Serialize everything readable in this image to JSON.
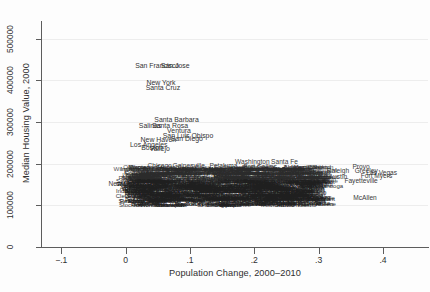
{
  "chart_data": {
    "type": "scatter",
    "title": "",
    "xlabel": "Population Change, 2000–2010",
    "ylabel": "Median Housing Value, 2000",
    "xlim": [
      -0.13,
      0.47
    ],
    "ylim": [
      0,
      540000
    ],
    "xticks": [
      -0.1,
      0,
      0.1,
      0.2,
      0.3,
      0.4
    ],
    "xticklabels": [
      "−.1",
      "0",
      ".1",
      ".2",
      ".3",
      ".4"
    ],
    "yticks": [
      0,
      100000,
      200000,
      300000,
      400000,
      500000
    ],
    "yticklabels": [
      "0",
      "100000",
      "200000",
      "300000",
      "400000",
      "500000"
    ],
    "grid": "horizontal",
    "legend": "none",
    "marker_style": "text-labels",
    "note": "Each observation is rendered as the metro-area name rather than a point marker; the central mass of labels overplots into a solid band.",
    "points": [
      {
        "label": "San Francisco",
        "x": 0.049,
        "y": 437000
      },
      {
        "label": "San Jose",
        "x": 0.077,
        "y": 437000
      },
      {
        "label": "New York",
        "x": 0.055,
        "y": 396000
      },
      {
        "label": "Santa Cruz",
        "x": 0.058,
        "y": 383000
      },
      {
        "label": "Santa Barbara",
        "x": 0.079,
        "y": 307000
      },
      {
        "label": "Santa Rosa",
        "x": 0.069,
        "y": 294000
      },
      {
        "label": "Salinas",
        "x": 0.038,
        "y": 292000
      },
      {
        "label": "Ventura",
        "x": 0.083,
        "y": 281000
      },
      {
        "label": "San Luis Obispo",
        "x": 0.097,
        "y": 268000
      },
      {
        "label": "San Diego",
        "x": 0.095,
        "y": 262000
      },
      {
        "label": "New Haven",
        "x": 0.051,
        "y": 259000
      },
      {
        "label": "Los Angeles",
        "x": 0.036,
        "y": 247000
      },
      {
        "label": "Boston",
        "x": 0.041,
        "y": 239000
      },
      {
        "label": "Vallejo",
        "x": 0.053,
        "y": 238000
      },
      {
        "label": "Washington",
        "x": 0.197,
        "y": 206000
      },
      {
        "label": "Santa Fe",
        "x": 0.247,
        "y": 206000
      },
      {
        "label": "Chicago",
        "x": 0.053,
        "y": 196000
      },
      {
        "label": "Gainesville",
        "x": 0.098,
        "y": 196000
      },
      {
        "label": "Petaluma",
        "x": 0.152,
        "y": 196000
      },
      {
        "label": "Fort Collins",
        "x": 0.209,
        "y": 194000
      },
      {
        "label": "Naples",
        "x": 0.263,
        "y": 192000
      },
      {
        "label": "Raleigh",
        "x": 0.33,
        "y": 186000
      },
      {
        "label": "Provo",
        "x": 0.366,
        "y": 195000
      },
      {
        "label": "Greeley",
        "x": 0.374,
        "y": 186000
      },
      {
        "label": "Las Vegas",
        "x": 0.398,
        "y": 181000
      },
      {
        "label": "Fort Myers",
        "x": 0.39,
        "y": 172000
      },
      {
        "label": "Fayetteville",
        "x": 0.366,
        "y": 160000
      },
      {
        "label": "Detroit",
        "x": 0.024,
        "y": 173000
      },
      {
        "label": "Providence",
        "x": 0.048,
        "y": 173000
      },
      {
        "label": "Pittsburgh",
        "x": 0.036,
        "y": 164000
      },
      {
        "label": "New Orleans",
        "x": 0.003,
        "y": 153000
      },
      {
        "label": "Youngstown",
        "x": 0.021,
        "y": 142000
      },
      {
        "label": "Pine Bluff",
        "x": 0.02,
        "y": 131000
      },
      {
        "label": "Salt Lake City",
        "x": 0.163,
        "y": 183000
      },
      {
        "label": "Nashville",
        "x": 0.14,
        "y": 166000
      },
      {
        "label": "Phoenix",
        "x": 0.2,
        "y": 166000
      },
      {
        "label": "Austin",
        "x": 0.33,
        "y": 170000
      },
      {
        "label": "Bakersfield",
        "x": 0.253,
        "y": 155000
      },
      {
        "label": "Odessa",
        "x": 0.205,
        "y": 122000
      },
      {
        "label": "Brownsville",
        "x": 0.262,
        "y": 120000
      },
      {
        "label": "McAllen",
        "x": 0.372,
        "y": 120000
      },
      {
        "label": "Laredo",
        "x": 0.296,
        "y": 131000
      },
      {
        "label": "Colorado Springs",
        "x": 0.247,
        "y": 176000
      }
    ]
  },
  "axes": {
    "y_title": "Median Housing Value, 2000",
    "x_title": "Population Change, 2000–2010",
    "y_tick_labels": [
      "0",
      "100000",
      "200000",
      "300000",
      "400000",
      "500000"
    ],
    "x_tick_labels": [
      "−.1",
      "0",
      ".1",
      ".2",
      ".3",
      ".4"
    ]
  },
  "dense_band": {
    "rows": [
      "Seattle Denver Portland Minneapolis Sacramento Baltimore Hartford Worcester Stockton Modesto Fresno Reno Tucson Boise Olympia Bremerton Bellingham Wenatchee",
      "Philadelphia Milwaukee Cleveland Columbus Cincinnati Kansas City St. Louis Indianapolis Louisville Memphis Birmingham Richmond Norfolk Charlotte Atlanta Orlando Tampa Jacksonville",
      "Buffalo Rochester Syracuse Albany Scranton Allentown Harrisburg Lancaster Reading Erie Toledo Dayton Akron Canton Flint Lansing Grand Rapids South Bend Fort Wayne Peoria Rockford",
      "Shreveport Baton Rouge Jackson Mobile Montgomery Huntsville Chattanooga Knoxville Greensboro Columbia Augusta Savannah Macon Charleston Wilmington Lakeland Ocala Sarasota Daytona",
      "Wichita Tulsa Oklahoma City Omaha Des Moines Lincoln Topeka Springfield Little Rock Fort Smith Amarillo Lubbock Abilene Waco Killeen Tyler Beaumont Corpus Christi El Paso"
    ]
  }
}
